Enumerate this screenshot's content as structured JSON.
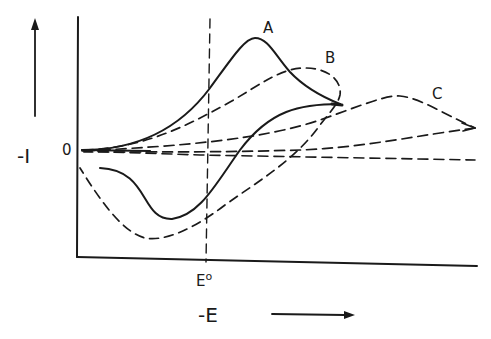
{
  "figure": {
    "type": "cyclic-voltammogram-schematic",
    "y_axis": {
      "label": "-I",
      "zero_label": "0",
      "direction": "up"
    },
    "x_axis": {
      "label": "-E",
      "direction": "right",
      "marker_label": "E°"
    },
    "curves": [
      {
        "id": "A",
        "label": "A",
        "style": "solid",
        "description": "reversible"
      },
      {
        "id": "B",
        "label": "B",
        "style": "dashed",
        "description": "quasi-reversible"
      },
      {
        "id": "C",
        "label": "C",
        "style": "dashed",
        "description": "irreversible"
      }
    ],
    "colors": {
      "line": "#1a1a1a",
      "background": "#ffffff"
    }
  },
  "labels": {
    "curve_a": "A",
    "curve_b": "B",
    "curve_c": "C",
    "zero": "0",
    "y_axis": "-I",
    "x_marker": "E",
    "x_marker_sup": "o",
    "x_axis": "-E"
  }
}
